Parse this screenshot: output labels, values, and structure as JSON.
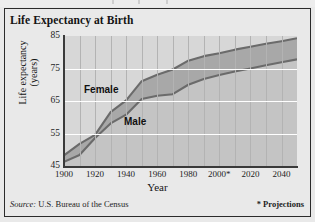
{
  "figure": {
    "title": "Life Expectancy at Birth",
    "source_word": "Source:",
    "source_text": " U.S. Bureau of the Census",
    "projections_note": "* Projections"
  },
  "colors": {
    "page_background": "#e9e9e9",
    "plot_background": "#d7d7d7",
    "band_fill": "#a8a8a8",
    "under_fill": "#c4c4c4",
    "line": "#6b6b6b",
    "hgridline": "#ffffff",
    "vgridline": "#b3b3b3",
    "axis": "#3a3a3a",
    "text": "#141414"
  },
  "chart_data": {
    "type": "area",
    "title": "Life Expectancy at Birth",
    "xlabel": "Year",
    "ylabel": "Life expectancy (years)",
    "ylabel_line1": "Life expectancy",
    "ylabel_line2": "(years)",
    "xlim": [
      1900,
      2050
    ],
    "ylim": [
      45,
      85
    ],
    "yticks": [
      45,
      55,
      65,
      75,
      85
    ],
    "ytick_labels": [
      "45",
      "55",
      "65",
      "75",
      "85"
    ],
    "xticks": [
      1900,
      1920,
      1940,
      1960,
      1980,
      2000,
      2020,
      2040
    ],
    "xtick_labels": [
      "1900",
      "1920",
      "1940",
      "1960",
      "1980",
      "2000*",
      "2020",
      "2040"
    ],
    "grid": {
      "horizontal": true,
      "vertical": true,
      "vertical_interval": 10
    },
    "legend": "inline-labels",
    "annotations": [
      {
        "text": "Female",
        "x": 1925,
        "y": 71
      },
      {
        "text": "Male",
        "x": 1950,
        "y": 60
      }
    ],
    "x": [
      1900,
      1910,
      1920,
      1930,
      1940,
      1950,
      1960,
      1970,
      1980,
      1990,
      2000,
      2010,
      2020,
      2030,
      2040,
      2050
    ],
    "series": [
      {
        "name": "Female",
        "values": [
          48.3,
          51.8,
          54.6,
          61.6,
          65.2,
          71.1,
          73.1,
          74.7,
          77.4,
          78.8,
          79.7,
          80.8,
          81.7,
          82.6,
          83.4,
          84.3
        ]
      },
      {
        "name": "Male",
        "values": [
          46.3,
          48.4,
          53.6,
          58.1,
          60.8,
          65.6,
          66.6,
          67.1,
          70.0,
          71.8,
          73.0,
          74.1,
          75.0,
          76.0,
          76.9,
          77.8
        ]
      }
    ]
  }
}
